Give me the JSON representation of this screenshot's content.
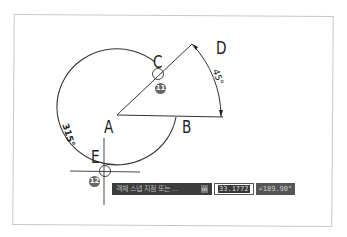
{
  "diagram": {
    "points": {
      "A": {
        "label": "A"
      },
      "B": {
        "label": "B"
      },
      "C": {
        "label": "C"
      },
      "D": {
        "label": "D"
      },
      "E": {
        "label": "E"
      }
    },
    "angles": {
      "arc_small": "45°",
      "arc_large": "315°"
    },
    "badges": {
      "c": "11",
      "e": "12"
    }
  },
  "input_bar": {
    "prompt": "객체 스냅 지점 또는 ...",
    "key": "m",
    "distance_value": "33.1772",
    "angle_value": "∠189.90°"
  },
  "colors": {
    "line": "#333333",
    "bar_bg": "#3c3c3c"
  }
}
